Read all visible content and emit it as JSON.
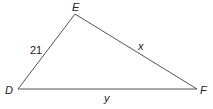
{
  "diagram": {
    "type": "triangle",
    "stroke_color": "#555555",
    "vertices": [
      {
        "name": "D",
        "x": 18,
        "y": 89
      },
      {
        "name": "E",
        "x": 75,
        "y": 14
      },
      {
        "name": "F",
        "x": 197,
        "y": 89
      }
    ],
    "vertex_labels": {
      "D": "D",
      "E": "E",
      "F": "F"
    },
    "side_labels": {
      "DE": "21",
      "EF": "x",
      "DF": "y"
    }
  }
}
